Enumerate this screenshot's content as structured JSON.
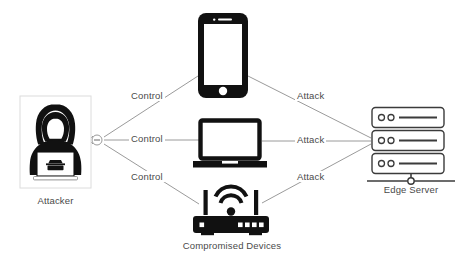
{
  "diagram": {
    "type": "network-attack-topology",
    "background_color": "#ffffff",
    "line_color": "#8a8a8a",
    "icon_color": "#111111",
    "text_color": "#4a4a4a"
  },
  "nodes": [
    {
      "id": "attacker",
      "label": "Attacker",
      "icon": "hooded-hacker-with-laptop-icon",
      "boxed": true,
      "x": 55,
      "y": 142
    },
    {
      "id": "smartphone",
      "label": "",
      "icon": "smartphone-icon",
      "boxed": false,
      "x": 222,
      "y": 55
    },
    {
      "id": "laptop",
      "label": "",
      "icon": "laptop-icon",
      "boxed": false,
      "x": 230,
      "y": 141
    },
    {
      "id": "router",
      "label": "",
      "icon": "wifi-router-icon",
      "boxed": false,
      "x": 230,
      "y": 213
    },
    {
      "id": "edge-server",
      "label": "Edge Server",
      "icon": "server-rack-icon",
      "boxed": false,
      "x": 410,
      "y": 140
    }
  ],
  "group_labels": [
    {
      "id": "compromised-devices",
      "text": "Compromised Devices",
      "x": 232,
      "y": 246
    }
  ],
  "edges": [
    {
      "id": "control-phone",
      "from": "attacker",
      "to": "smartphone",
      "label": "Control",
      "label_x": 148,
      "label_y": 97
    },
    {
      "id": "control-laptop",
      "from": "attacker",
      "to": "laptop",
      "label": "Control",
      "label_x": 148,
      "label_y": 140
    },
    {
      "id": "control-router",
      "from": "attacker",
      "to": "router",
      "label": "Control",
      "label_x": 148,
      "label_y": 178
    },
    {
      "id": "attack-phone",
      "from": "smartphone",
      "to": "edge-server",
      "label": "Attack",
      "label_x": 312,
      "label_y": 97
    },
    {
      "id": "attack-laptop",
      "from": "laptop",
      "to": "edge-server",
      "label": "Attack",
      "label_x": 312,
      "label_y": 141
    },
    {
      "id": "attack-router",
      "from": "router",
      "to": "edge-server",
      "label": "Attack",
      "label_x": 312,
      "label_y": 178
    }
  ],
  "connectors": [
    {
      "id": "attacker-junction",
      "shape": "circle-with-dash",
      "x": 97,
      "y": 140
    },
    {
      "id": "server-stand-node",
      "shape": "hollow-circle",
      "x": 411,
      "y": 181
    }
  ]
}
